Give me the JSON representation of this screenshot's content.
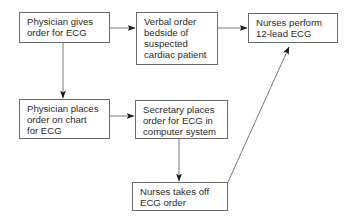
{
  "diagram": {
    "type": "flowchart",
    "nodes": [
      {
        "id": "n1",
        "label": "Physician gives\norder for ECG"
      },
      {
        "id": "n2",
        "label": "Verbal order\nbedside of\nsuspected\ncardiac patient"
      },
      {
        "id": "n3",
        "label": "Nurses perform\n12-lead ECG"
      },
      {
        "id": "n4",
        "label": "Physician places\norder on chart\nfor ECG"
      },
      {
        "id": "n5",
        "label": "Secretary places\norder for ECG in\ncomputer system"
      },
      {
        "id": "n6",
        "label": "Nurses takes off\nECG order"
      }
    ],
    "edges": [
      {
        "from": "n1",
        "to": "n2"
      },
      {
        "from": "n2",
        "to": "n3"
      },
      {
        "from": "n1",
        "to": "n4"
      },
      {
        "from": "n4",
        "to": "n5"
      },
      {
        "from": "n5",
        "to": "n6"
      },
      {
        "from": "n6",
        "to": "n3"
      }
    ]
  }
}
